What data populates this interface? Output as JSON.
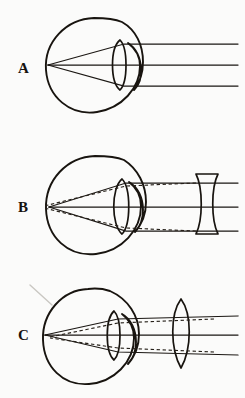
{
  "figure": {
    "background_color": "#fbfbfa",
    "ink_color": "#18140f",
    "artifact_color": "#c9c7c2",
    "panel_count": 3
  },
  "panels": [
    {
      "label": "A",
      "title": "Uncorrected eye, parallel rays converge to a point",
      "eye": {
        "globe_shape": "circle",
        "cornea": "anterior bulge",
        "internal_lens": "biconvex crystalline lens"
      },
      "external_lens": {
        "present": false,
        "type": "none"
      },
      "rays": {
        "count": 3,
        "incoming": "parallel horizontal",
        "solid_paths": 3,
        "dashed_paths": 0,
        "focal_point": "on the retina at the back of the globe"
      }
    },
    {
      "label": "B",
      "title": "Myopic eye corrected with a diverging lens",
      "eye": {
        "globe_shape": "circle",
        "cornea": "anterior bulge",
        "internal_lens": "biconvex crystalline lens"
      },
      "external_lens": {
        "present": true,
        "type": "biconcave diverging lens",
        "position": "right of the eye"
      },
      "rays": {
        "count": 3,
        "incoming": "parallel horizontal",
        "solid_paths": 3,
        "dashed_paths": 2,
        "focal_point": "two foci, dashed rays focus anterior to the solid focus"
      }
    },
    {
      "label": "C",
      "title": "Hyperopic eye corrected with a converging lens",
      "eye": {
        "globe_shape": "circle",
        "cornea": "anterior bulge",
        "internal_lens": "biconvex crystalline lens"
      },
      "external_lens": {
        "present": true,
        "type": "biconvex converging lens",
        "position": "right of the eye"
      },
      "rays": {
        "count": 3,
        "incoming": "parallel horizontal",
        "solid_paths": 3,
        "dashed_paths": 2,
        "focal_point": "two foci, dashed rays focus posterior to the solid focus"
      }
    }
  ]
}
